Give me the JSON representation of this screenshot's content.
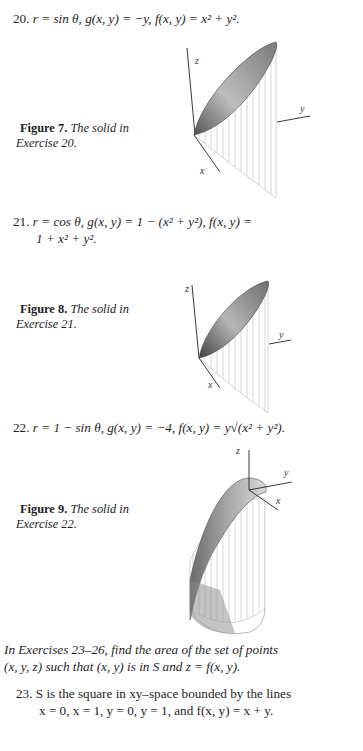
{
  "exercises": {
    "ex20": {
      "number": "20.",
      "text": "r = sin θ, g(x, y) = −y, f(x, y) = x² + y²."
    },
    "ex21": {
      "number": "21.",
      "line1": "r  =  cos θ, g(x, y)  =  1 − (x² + y²), f(x, y)  =",
      "line2": "1 + x² + y²."
    },
    "ex22": {
      "number": "22.",
      "text": "r = 1 − sin θ, g(x, y) = −4, f(x, y) = y√(x² + y²)."
    },
    "ex23": {
      "number": "23.",
      "line1": "S is the square in xy–space bounded by the lines",
      "line2": "x = 0, x = 1, y = 0, y = 1, and f(x, y) = x + y."
    }
  },
  "figures": [
    {
      "label": "Figure 7.",
      "caption_line1": "The solid in",
      "caption_line2": "Exercise 20.",
      "axes": {
        "z": "z",
        "y": "y",
        "x": "x"
      }
    },
    {
      "label": "Figure 8.",
      "caption_line1": "The solid in",
      "caption_line2": "Exercise 21.",
      "axes": {
        "z": "z",
        "y": "y",
        "x": "x"
      }
    },
    {
      "label": "Figure 9.",
      "caption_line1": "The solid in",
      "caption_line2": "Exercise 22.",
      "axes": {
        "z": "z",
        "y": "y",
        "x": "x"
      }
    }
  ],
  "intro": {
    "line1": "In Exercises 23–26, find the area of the set of points",
    "line2": "(x, y, z) such that (x, y) is in S and z = f(x, y)."
  }
}
